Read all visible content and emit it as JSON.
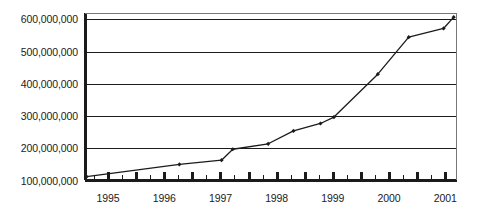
{
  "chart_data": {
    "type": "line",
    "title": "",
    "subtitle": "",
    "xlabel": "",
    "ylabel": "",
    "grid": "horizontal",
    "legend": "none",
    "xlim": [
      1994.6,
      2001.2
    ],
    "ylim": [
      100000000,
      620000000
    ],
    "x_tick_labels": [
      "1995",
      "1996",
      "1997",
      "1998",
      "1999",
      "2000",
      "2001"
    ],
    "x_tick_values": [
      1995,
      1996,
      1997,
      1998,
      1999,
      2000,
      2001
    ],
    "x_minor_ticks_per_interval": 3,
    "y_tick_labels": [
      "100,000,000",
      "200,000,000",
      "300,000,000",
      "400,000,000",
      "500,000,000",
      "600,000,000"
    ],
    "y_tick_values": [
      100000000,
      200000000,
      300000000,
      400000000,
      500000000,
      600000000
    ],
    "series": [
      {
        "name": "series-1",
        "marker": "diamond",
        "color": "#1b1b1b",
        "x": [
          1994.62,
          1996.27,
          1997.02,
          1997.22,
          1997.85,
          1998.3,
          1998.78,
          1999.02,
          1999.8,
          2000.35,
          2000.97,
          2001.15
        ],
        "values": [
          112000000,
          150000000,
          163000000,
          197000000,
          214000000,
          254000000,
          277000000,
          297000000,
          430000000,
          545000000,
          572000000,
          607000000
        ]
      }
    ],
    "colors": {
      "line": "#1b1b1b",
      "marker": "#1b1b1b",
      "gridline": "#1b1b1b",
      "axis": "#2a2a2a",
      "plot_background": "#ffffff",
      "text": "#1b1b1b"
    }
  }
}
